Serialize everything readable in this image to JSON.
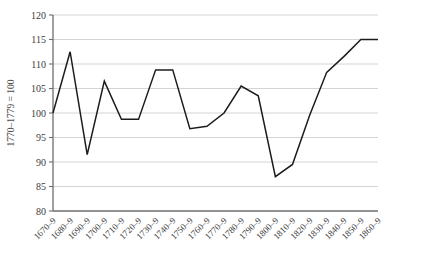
{
  "chart_data": {
    "type": "line",
    "title": "",
    "xlabel": "",
    "ylabel": "1770–1779 = 100",
    "ylim": [
      80,
      120
    ],
    "ytick_step": 5,
    "yticks": [
      80,
      85,
      90,
      95,
      100,
      105,
      110,
      115,
      120
    ],
    "ytick_labels": [
      "80",
      "85",
      "90",
      "95",
      "100",
      "105",
      "110",
      "115",
      "120"
    ],
    "grid": true,
    "grid_axis": "y",
    "legend": false,
    "legend_position": "none",
    "categories": [
      "1670–9",
      "1680–9",
      "1690–9",
      "1700–9",
      "1710–9",
      "1720–9",
      "1730–9",
      "1740–9",
      "1750–9",
      "1760–9",
      "1770–9",
      "1780–9",
      "1790–9",
      "1800–9",
      "1810–9",
      "1820–9",
      "1830–9",
      "1840–9",
      "1850–9",
      "1860–9"
    ],
    "values": [
      100.0,
      112.5,
      91.5,
      106.5,
      98.7,
      98.7,
      108.8,
      108.8,
      96.8,
      97.3,
      100.0,
      105.5,
      103.5,
      87.0,
      89.5,
      99.5,
      108.3,
      111.5,
      115.0,
      115.0
    ],
    "series": [
      {
        "name": "index",
        "color": "#1c1c1c",
        "values": [
          100.0,
          112.5,
          91.5,
          106.5,
          98.7,
          98.7,
          108.8,
          108.8,
          96.8,
          97.3,
          100.0,
          105.5,
          103.5,
          87.0,
          89.5,
          99.5,
          108.3,
          111.5,
          115.0,
          115.0
        ]
      }
    ],
    "colors": {
      "line": "#1c1c1c",
      "grid": "#c9c9c9",
      "axis": "#6e6e6e",
      "text": "#3c3c3c",
      "background": "#ffffff"
    }
  }
}
